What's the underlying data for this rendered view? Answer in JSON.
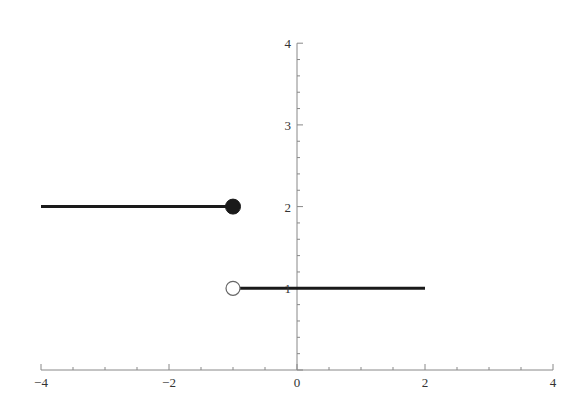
{
  "chart_data": {
    "type": "line",
    "title": "",
    "xlabel": "",
    "ylabel": "",
    "xlim": [
      -4,
      4
    ],
    "ylim": [
      0,
      4
    ],
    "grid": false,
    "legend": null,
    "x_ticks": [
      -4,
      -2,
      0,
      2,
      4
    ],
    "x_tick_labels": [
      "−4",
      "−2",
      "0",
      "2",
      "4"
    ],
    "y_ticks": [
      1,
      2,
      3,
      4
    ],
    "y_tick_labels": [
      "1",
      "2",
      "3",
      "4"
    ],
    "series": [
      {
        "name": "piece-left",
        "x": [
          -4,
          -1
        ],
        "y": [
          2,
          2
        ],
        "color": "#1a1a1a",
        "end_marker": {
          "x": -1,
          "y": 2,
          "style": "closed"
        }
      },
      {
        "name": "piece-right",
        "x": [
          -1,
          2
        ],
        "y": [
          1,
          1
        ],
        "color": "#1a1a1a",
        "start_marker": {
          "x": -1,
          "y": 1,
          "style": "open"
        }
      }
    ],
    "annotations": []
  },
  "style": {
    "axis_color": "#888888",
    "line_color": "#1a1a1a",
    "label_color": "#333333"
  }
}
